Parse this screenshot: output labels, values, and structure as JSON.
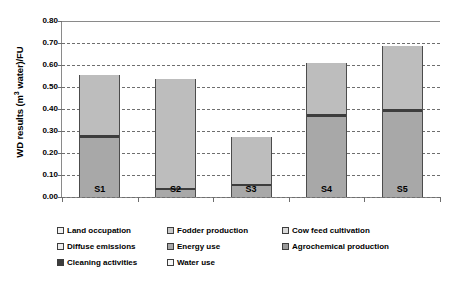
{
  "chart_data": {
    "type": "bar",
    "stacked": true,
    "title": "",
    "xlabel": "",
    "ylabel": "WD results (m3 water)/FU",
    "ylabel_html": "WD results (m<sup>3</sup> water)/FU",
    "categories": [
      "S1",
      "S2",
      "S3",
      "S4",
      "S5"
    ],
    "ylim": [
      0.0,
      0.8
    ],
    "ytick_labels": [
      "0.00",
      "0.10",
      "0.20",
      "0.30",
      "0.40",
      "0.50",
      "0.60",
      "0.70",
      "0.80"
    ],
    "ytick_values": [
      0.0,
      0.1,
      0.2,
      0.3,
      0.4,
      0.5,
      0.6,
      0.7,
      0.8
    ],
    "grid": true,
    "grid_style": "dashed-horizontal",
    "legend_position": "bottom",
    "series": [
      {
        "name": "Land occupation",
        "color": "#f2f2f2",
        "values": [
          0.0,
          0.0,
          0.0,
          0.0,
          0.0
        ]
      },
      {
        "name": "Fodder production",
        "color": "#c9c9c9",
        "values": [
          0.0,
          0.0,
          0.0,
          0.0,
          0.0
        ]
      },
      {
        "name": "Cow feed cultivation",
        "color": "#d9d9d9",
        "values": [
          0.0,
          0.0,
          0.0,
          0.0,
          0.0
        ]
      },
      {
        "name": "Diffuse emissions",
        "color": "#ededed",
        "values": [
          0.0,
          0.0,
          0.0,
          0.0,
          0.0
        ]
      },
      {
        "name": "Energy use",
        "color": "#a8a8a8",
        "values": [
          0.27,
          0.03,
          0.048,
          0.363,
          0.385
        ]
      },
      {
        "name": "Agrochemical production",
        "color": "#9a9a9a",
        "values": [
          0.0,
          0.0,
          0.0,
          0.0,
          0.0
        ]
      },
      {
        "name": "Cleaning activities",
        "color": "#3d3d3d",
        "values": [
          0.012,
          0.01,
          0.012,
          0.014,
          0.014
        ]
      },
      {
        "name": "Water use",
        "color": "#bdbdbd",
        "values": [
          0.273,
          0.495,
          0.215,
          0.233,
          0.286
        ]
      }
    ],
    "totals": [
      0.555,
      0.535,
      0.275,
      0.61,
      0.685
    ]
  },
  "legend": {
    "items": [
      {
        "label": "Land occupation",
        "swatch": "#f2f2f2"
      },
      {
        "label": "Fodder production",
        "swatch": "#c9c9c9"
      },
      {
        "label": "Cow feed cultivation",
        "swatch": "#d9d9d9"
      },
      {
        "label": "Diffuse emissions",
        "swatch": "#ededed"
      },
      {
        "label": "Energy use",
        "swatch": "#a8a8a8"
      },
      {
        "label": "Agrochemical production",
        "swatch": "#9a9a9a"
      },
      {
        "label": "Cleaning activities",
        "swatch": "#3d3d3d"
      },
      {
        "label": "Water use",
        "swatch": "#f7f7f7"
      }
    ]
  },
  "axis": {
    "y_title": "WD results (m3 water)/FU"
  }
}
